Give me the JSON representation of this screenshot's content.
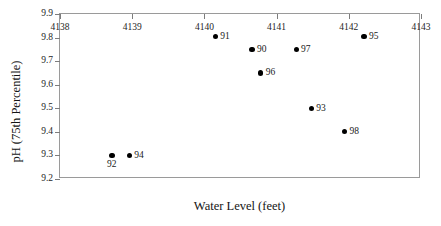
{
  "chart_data": {
    "type": "scatter",
    "title": "",
    "xlabel": "Water Level (feet)",
    "ylabel": "pH (75th Percentile)",
    "xlim": [
      4138,
      4143
    ],
    "ylim": [
      9.2,
      9.9
    ],
    "grid": false,
    "legend": "none",
    "xticks": [
      "4138",
      "4139",
      "4140",
      "4141",
      "4142",
      "4143"
    ],
    "xtick_values": [
      4138,
      4139,
      4140,
      4141,
      4142,
      4143
    ],
    "yticks": [
      "9.2",
      "9.3",
      "9.4",
      "9.5",
      "9.6",
      "9.7",
      "9.8",
      "9.9"
    ],
    "ytick_values": [
      9.2,
      9.3,
      9.4,
      9.5,
      9.6,
      9.7,
      9.8,
      9.9
    ],
    "point_color": "#000000",
    "axis_color": "#9a9a9a",
    "points": [
      {
        "label": "92",
        "x": 4138.72,
        "y": 9.3,
        "label_pos": "below"
      },
      {
        "label": "94",
        "x": 4138.96,
        "y": 9.3,
        "label_pos": "right"
      },
      {
        "label": "91",
        "x": 4140.15,
        "y": 9.805,
        "label_pos": "right"
      },
      {
        "label": "90",
        "x": 4140.66,
        "y": 9.75,
        "label_pos": "right"
      },
      {
        "label": "96",
        "x": 4140.78,
        "y": 9.65,
        "label_pos": "right"
      },
      {
        "label": "97",
        "x": 4141.27,
        "y": 9.75,
        "label_pos": "right"
      },
      {
        "label": "93",
        "x": 4141.48,
        "y": 9.5,
        "label_pos": "right"
      },
      {
        "label": "98",
        "x": 4141.94,
        "y": 9.4,
        "label_pos": "right"
      },
      {
        "label": "95",
        "x": 4142.21,
        "y": 9.805,
        "label_pos": "right"
      }
    ]
  }
}
